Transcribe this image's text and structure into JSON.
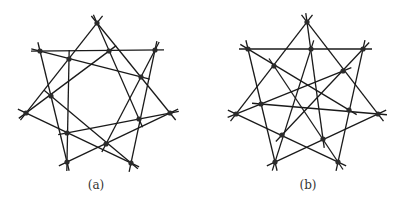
{
  "figure": {
    "panels": [
      {
        "id": "a",
        "caption": "(a)",
        "line_color": "#1a1a1a",
        "node_color": "#2b2b2b",
        "nodes": {
          "T": [
            97,
            23
          ],
          "UL": [
            40,
            51
          ],
          "UR": [
            155,
            50
          ],
          "L": [
            26,
            113
          ],
          "R": [
            170,
            113
          ],
          "BL": [
            67,
            162
          ],
          "BR": [
            131,
            163
          ],
          "p1": [
            69,
            59
          ],
          "p2": [
            109,
            51
          ],
          "p3": [
            141,
            77
          ],
          "p4": [
            51,
            96
          ],
          "p5": [
            139,
            119
          ],
          "p6": [
            67,
            133
          ],
          "p7": [
            106,
            144
          ]
        },
        "lines": [
          [
            "UL",
            "p2",
            "UR"
          ],
          [
            "T",
            "p1",
            "L"
          ],
          [
            "T",
            "p3",
            "R"
          ],
          [
            "T",
            "p5"
          ],
          [
            "UL",
            "p1",
            "p3"
          ],
          [
            "L",
            "p2"
          ],
          [
            "p1",
            "p6",
            "BL"
          ],
          [
            "UL",
            "p4",
            "BL"
          ],
          [
            "p4",
            "p7",
            "BR"
          ],
          [
            "L",
            "p6",
            "BR"
          ],
          [
            "BL",
            "p7",
            "R"
          ],
          [
            "p7",
            "UR"
          ],
          [
            "BR",
            "p5",
            "UR"
          ],
          [
            "p6",
            "p5",
            "R"
          ]
        ]
      },
      {
        "id": "b",
        "caption": "(b)",
        "line_color": "#1a1a1a",
        "node_color": "#2b2b2b",
        "nodes": {
          "T": [
            307,
            22
          ],
          "UL": [
            248,
            49
          ],
          "UR": [
            363,
            49
          ],
          "L": [
            236,
            114
          ],
          "R": [
            378,
            114
          ],
          "BL": [
            275,
            162
          ],
          "BR": [
            338,
            162
          ],
          "a": [
            311,
            49
          ],
          "b": [
            274,
            66
          ],
          "c": [
            343,
            71
          ],
          "d": [
            261,
            104
          ],
          "e": [
            349,
            110
          ],
          "f": [
            282,
            135
          ],
          "g": [
            323,
            139
          ]
        },
        "lines": [
          [
            "UL",
            "a",
            "UR"
          ],
          [
            "T",
            "b",
            "L"
          ],
          [
            "T",
            "c",
            "R"
          ],
          [
            "T",
            "a",
            "g"
          ],
          [
            "UL",
            "b",
            "e"
          ],
          [
            "UL",
            "d",
            "BL"
          ],
          [
            "UR",
            "c",
            "f"
          ],
          [
            "UR",
            "e",
            "BR"
          ],
          [
            "L",
            "d",
            "c"
          ],
          [
            "d",
            "e",
            "R"
          ],
          [
            "L",
            "f",
            "BR"
          ],
          [
            "b",
            "g",
            "BR"
          ],
          [
            "BL",
            "f",
            "a"
          ],
          [
            "BL",
            "g",
            "R"
          ]
        ]
      }
    ]
  }
}
